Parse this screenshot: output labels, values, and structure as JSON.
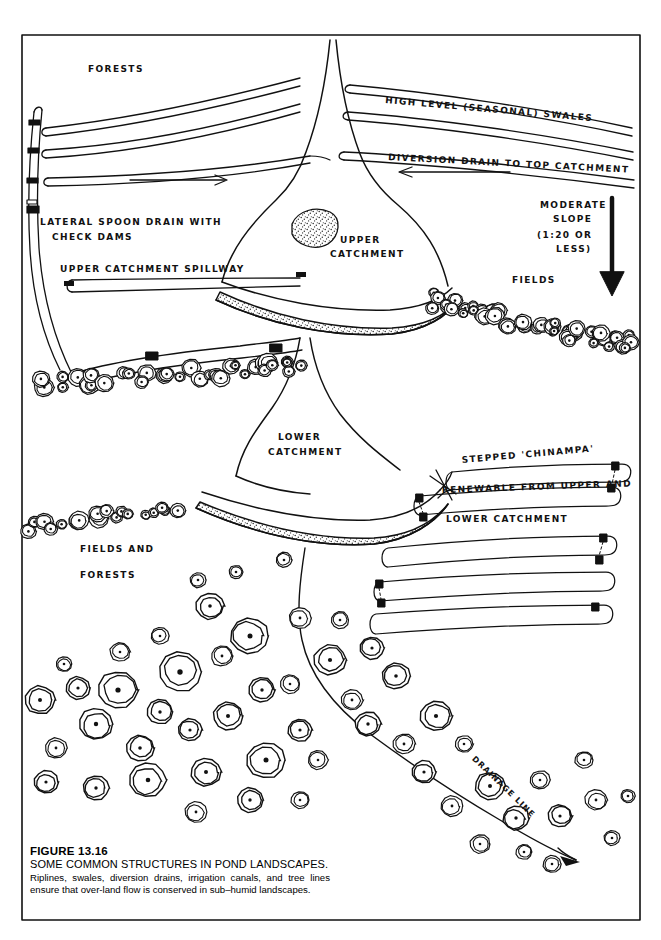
{
  "figure": {
    "number": "FIGURE 13.16",
    "title": "SOME COMMON STRUCTURES IN POND LANDSCAPES.",
    "caption": "Riplines, swales, diversion drains, irrigation canals, and tree lines ensure that over-land flow is conserved in sub–humid landscapes."
  },
  "labels": {
    "forests_top": "FORESTS",
    "high_level_swales": "HIGH LEVEL (SEASONAL) SWALES",
    "diversion_drain": "DIVERSION DRAIN TO TOP CATCHMENT",
    "lateral_drain_l1": "LATERAL SPOON DRAIN WITH",
    "lateral_drain_l2": "CHECK DAMS",
    "upper_spillway": "UPPER CATCHMENT SPILLWAY",
    "upper_catchment_l1": "UPPER",
    "upper_catchment_l2": "CATCHMENT",
    "moderate_slope_l1": "MODERATE",
    "moderate_slope_l2": "SLOPE",
    "moderate_slope_l3": "(1:20 OR",
    "moderate_slope_l4": "LESS)",
    "fields_right": "FIELDS",
    "lower_catchment_l1": "LOWER",
    "lower_catchment_l2": "CATCHMENT",
    "chinampa": "STEPPED 'CHINAMPA'",
    "renewable": "RENEWABLE FROM UPPER AND",
    "lower_catchment_line": "LOWER CATCHMENT",
    "fields_forests_l1": "FIELDS AND",
    "fields_forests_l2": "FORESTS",
    "drainage_line": "DRAINAGE LINE"
  },
  "colors": {
    "ink": "#111111",
    "paper": "#ffffff",
    "stipple": "#2a2a2a"
  },
  "icons": {
    "slope_arrow": "down-arrow-icon",
    "flow_arrow_right": "right-arrow-icon",
    "flow_arrow_left": "left-arrow-icon",
    "check_dam": "check-dam-marker-icon",
    "tree": "tree-plan-circle-icon"
  }
}
